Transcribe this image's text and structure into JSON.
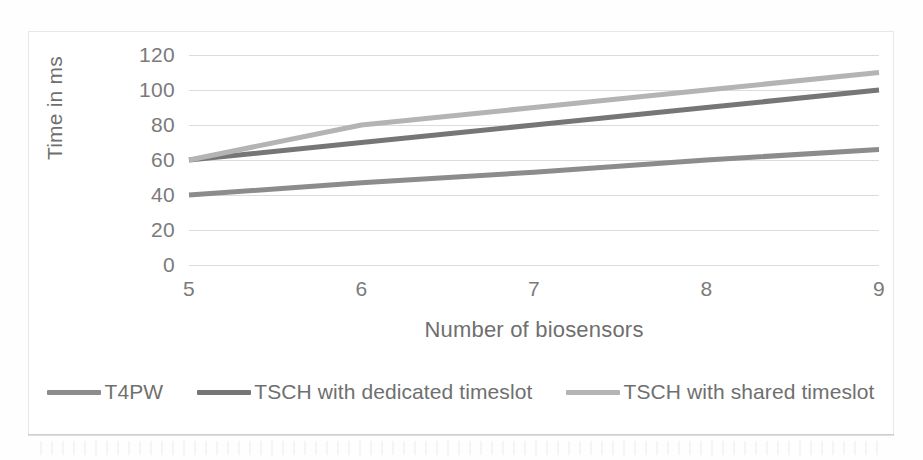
{
  "chart_data": {
    "type": "line",
    "title": "",
    "xlabel": "Number of biosensors",
    "ylabel": "Time in ms",
    "x": [
      5,
      6,
      7,
      8,
      9
    ],
    "xticklabels": [
      "5",
      "6",
      "7",
      "8",
      "9"
    ],
    "yticklabels": [
      "0",
      "20",
      "40",
      "60",
      "80",
      "100",
      "120"
    ],
    "yticks": [
      0,
      20,
      40,
      60,
      80,
      100,
      120
    ],
    "ylim": [
      0,
      120
    ],
    "xlim": [
      5,
      9
    ],
    "grid": "horizontal",
    "legend_position": "bottom",
    "series": [
      {
        "name": "T4PW",
        "color": "#8c8c8c",
        "values": [
          40,
          47,
          53,
          60,
          66
        ]
      },
      {
        "name": "TSCH with dedicated timeslot",
        "color": "#767676",
        "values": [
          60,
          70,
          80,
          90,
          100
        ]
      },
      {
        "name": "TSCH with shared timeslot",
        "color": "#b4b4b4",
        "values": [
          60,
          80,
          90,
          100,
          110
        ]
      }
    ]
  },
  "colors": {
    "gridline": "#dcdcdc",
    "axis_text": "#7b7b7b",
    "frame_border": "#e8e8e8",
    "background": "#ffffff"
  }
}
